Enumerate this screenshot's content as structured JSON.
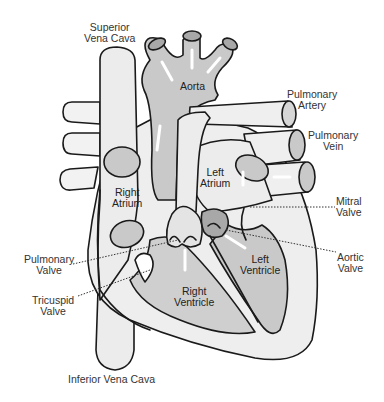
{
  "diagram": {
    "type": "anatomical-diagram",
    "colors": {
      "background": "#ffffff",
      "outline": "#1a1a1a",
      "light_fill": "#ebebeb",
      "mid_fill": "#c9c9c9",
      "dark_fill": "#a8a8a8",
      "arrow": "#ffffff",
      "leader_line": "#333333"
    },
    "labels": {
      "superior_vena_cava": {
        "line1": "Superior",
        "line2": "Vena Cava"
      },
      "aorta": {
        "line1": "Aorta"
      },
      "pulmonary_artery": {
        "line1": "Pulmonary",
        "line2": "Artery"
      },
      "pulmonary_vein": {
        "line1": "Pulmonary",
        "line2": "Vein"
      },
      "left_atrium": {
        "line1": "Left",
        "line2": "Atrium"
      },
      "right_atrium": {
        "line1": "Right",
        "line2": "Atrium"
      },
      "mitral_valve": {
        "line1": "Mitral",
        "line2": "Valve"
      },
      "aortic_valve": {
        "line1": "Aortic",
        "line2": "Valve"
      },
      "pulmonary_valve": {
        "line1": "Pulmonary",
        "line2": "Valve"
      },
      "tricuspid_valve": {
        "line1": "Tricuspid",
        "line2": "Valve"
      },
      "left_ventricle": {
        "line1": "Left",
        "line2": "Ventricle"
      },
      "right_ventricle": {
        "line1": "Right",
        "line2": "Ventricle"
      },
      "inferior_vena_cava": {
        "line1": "Inferior Vena Cava"
      }
    }
  }
}
